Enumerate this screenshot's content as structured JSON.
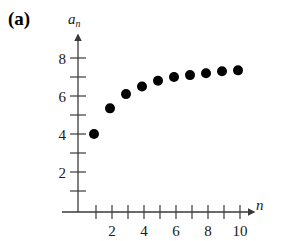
{
  "figure": {
    "panel_label": "(a)",
    "background_color": "#ffffff",
    "axis_color": "#3a3a3a",
    "point_color": "#000000"
  },
  "chart_data": {
    "type": "scatter",
    "title": "",
    "subtitle": "",
    "xlabel": "n",
    "ylabel": "a_n",
    "ylabel_display": "a",
    "ylabel_subscript": "n",
    "x": [
      1,
      2,
      3,
      4,
      5,
      6,
      7,
      8,
      9,
      10
    ],
    "values": [
      4.0,
      5.35,
      6.1,
      6.5,
      6.8,
      7.0,
      7.1,
      7.2,
      7.3,
      7.35
    ],
    "series": [
      {
        "name": "a_n",
        "x": [
          1,
          2,
          3,
          4,
          5,
          6,
          7,
          8,
          9,
          10
        ],
        "values": [
          4.0,
          5.35,
          6.1,
          6.5,
          6.8,
          7.0,
          7.1,
          7.2,
          7.3,
          7.35
        ]
      }
    ],
    "xlim": [
      0,
      11
    ],
    "ylim": [
      0,
      8.8
    ],
    "x_ticks": [
      1,
      2,
      3,
      4,
      5,
      6,
      7,
      8,
      9,
      10
    ],
    "x_tick_labels": [
      "",
      "2",
      "",
      "4",
      "",
      "6",
      "",
      "8",
      "",
      "10"
    ],
    "y_ticks": [
      1,
      2,
      3,
      4,
      5,
      6,
      7,
      8
    ],
    "y_tick_labels": [
      "",
      "2",
      "",
      "4",
      "",
      "6",
      "",
      "8"
    ],
    "grid": false,
    "legend": null,
    "annotations": [],
    "marker": "filled-circle",
    "marker_size": 5
  },
  "axis_marks": {
    "x_labels": [
      {
        "value": 2,
        "text": "2"
      },
      {
        "value": 4,
        "text": "4"
      },
      {
        "value": 6,
        "text": "6"
      },
      {
        "value": 8,
        "text": "8"
      },
      {
        "value": 10,
        "text": "10"
      }
    ],
    "y_labels": [
      {
        "value": 2,
        "text": "2"
      },
      {
        "value": 4,
        "text": "4"
      },
      {
        "value": 6,
        "text": "6"
      },
      {
        "value": 8,
        "text": "8"
      }
    ]
  }
}
